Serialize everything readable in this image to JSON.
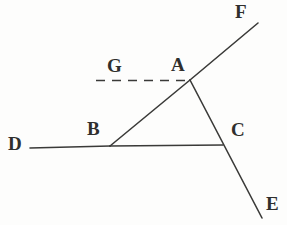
{
  "figure": {
    "width": 287,
    "height": 225,
    "background_color": "#fdfdfc",
    "ink_color": "#3a3a38",
    "stroke_width": 1.6
  },
  "labels": {
    "A": "A",
    "B": "B",
    "C": "C",
    "D": "D",
    "E": "E",
    "F": "F",
    "G": "G"
  },
  "points": [
    {
      "id": "A",
      "label": "A",
      "x": 190,
      "y": 80,
      "label_x": 171,
      "label_y": 55,
      "kind": "vertex"
    },
    {
      "id": "B",
      "label": "B",
      "x": 110,
      "y": 146,
      "label_x": 87,
      "label_y": 119,
      "kind": "vertex"
    },
    {
      "id": "C",
      "label": "C",
      "x": 223,
      "y": 146,
      "label_x": 231,
      "label_y": 120,
      "kind": "intersection"
    },
    {
      "id": "D",
      "label": "D",
      "x": 30,
      "y": 148,
      "label_x": 8,
      "label_y": 134,
      "kind": "ray-end"
    },
    {
      "id": "E",
      "label": "E",
      "x": 262,
      "y": 218,
      "label_x": 266,
      "label_y": 194,
      "kind": "ray-end"
    },
    {
      "id": "F",
      "label": "F",
      "x": 258,
      "y": 23,
      "label_x": 235,
      "label_y": 2,
      "kind": "ray-end"
    },
    {
      "id": "G",
      "label": "G",
      "x": 96,
      "y": 80,
      "label_x": 107,
      "label_y": 56,
      "kind": "ray-end"
    }
  ],
  "segments": [
    {
      "id": "GA",
      "from": "G",
      "to": "A",
      "x1": 96,
      "y1": 80.5,
      "x2": 190,
      "y2": 80.5,
      "style": "dashed",
      "dash": "9 7"
    },
    {
      "id": "DB",
      "from": "D",
      "to": "B",
      "x1": 30,
      "y1": 148,
      "x2": 110,
      "y2": 146,
      "style": "solid",
      "dash": ""
    },
    {
      "id": "BC",
      "from": "B",
      "to": "C",
      "x1": 110,
      "y1": 146,
      "x2": 223,
      "y2": 145,
      "style": "solid",
      "dash": ""
    },
    {
      "id": "BA",
      "from": "B",
      "to": "A",
      "x1": 110,
      "y1": 146,
      "x2": 190,
      "y2": 80,
      "style": "solid",
      "dash": ""
    },
    {
      "id": "AF",
      "from": "A",
      "to": "F",
      "x1": 190,
      "y1": 80,
      "x2": 258,
      "y2": 23,
      "style": "solid",
      "dash": ""
    },
    {
      "id": "AE",
      "from": "A",
      "to": "E",
      "x1": 190,
      "y1": 80,
      "x2": 262,
      "y2": 218,
      "style": "solid",
      "dash": ""
    }
  ]
}
